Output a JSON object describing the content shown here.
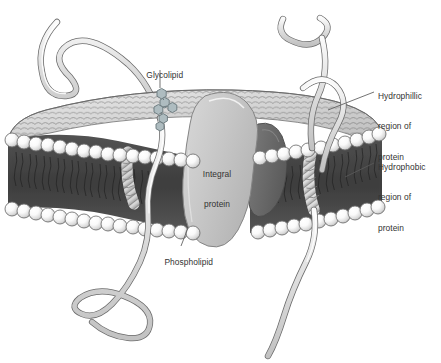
{
  "figure": {
    "type": "biological-diagram",
    "background_color": "#ffffff"
  },
  "labels": {
    "glycolipid": "Glycolipid",
    "integral_protein_line1": "Integral",
    "integral_protein_line2": "protein",
    "phospholipid": "Phospholipid",
    "hydrophillic_line1": "Hydrophillic",
    "hydrophillic_line2": "region of",
    "hydrophillic_line3": "protein",
    "hydrophobic_line1": "Hydrophobic",
    "hydrophobic_line2": "region of",
    "hydrophobic_line3": "protein"
  },
  "colors": {
    "text": "#333333",
    "leader_line": "#5a5a5a",
    "membrane_core": "#4a4a4a",
    "membrane_core_dark": "#3a3a3a",
    "head_sphere_light": "#ffffff",
    "head_sphere_shade": "#b8b8b8",
    "head_outline": "#5a5a5a",
    "top_surface": "#d5d5d5",
    "top_surface_mesh": "#6e6e6e",
    "integral_protein_fill": "#c8c8c8",
    "integral_protein_outline": "#808080",
    "secondary_protein_fill": "#6a6a6a",
    "filament_fill": "#dcdcdc",
    "filament_outline": "#6a6a6a",
    "glycolipid_fill": "#aebcc0",
    "glycolipid_outline": "#6d7b80",
    "tail_stroke": "#2e2e2e"
  },
  "components": {
    "bilayer": "phospholipid-bilayer",
    "integral_protein": "integral-membrane-protein",
    "secondary_protein": "secondary-membrane-protein",
    "helices": "transmembrane-alpha-helices",
    "filaments": "peripheral-protein-filaments",
    "glycolipid": "glycolipid-sugar-chain"
  }
}
